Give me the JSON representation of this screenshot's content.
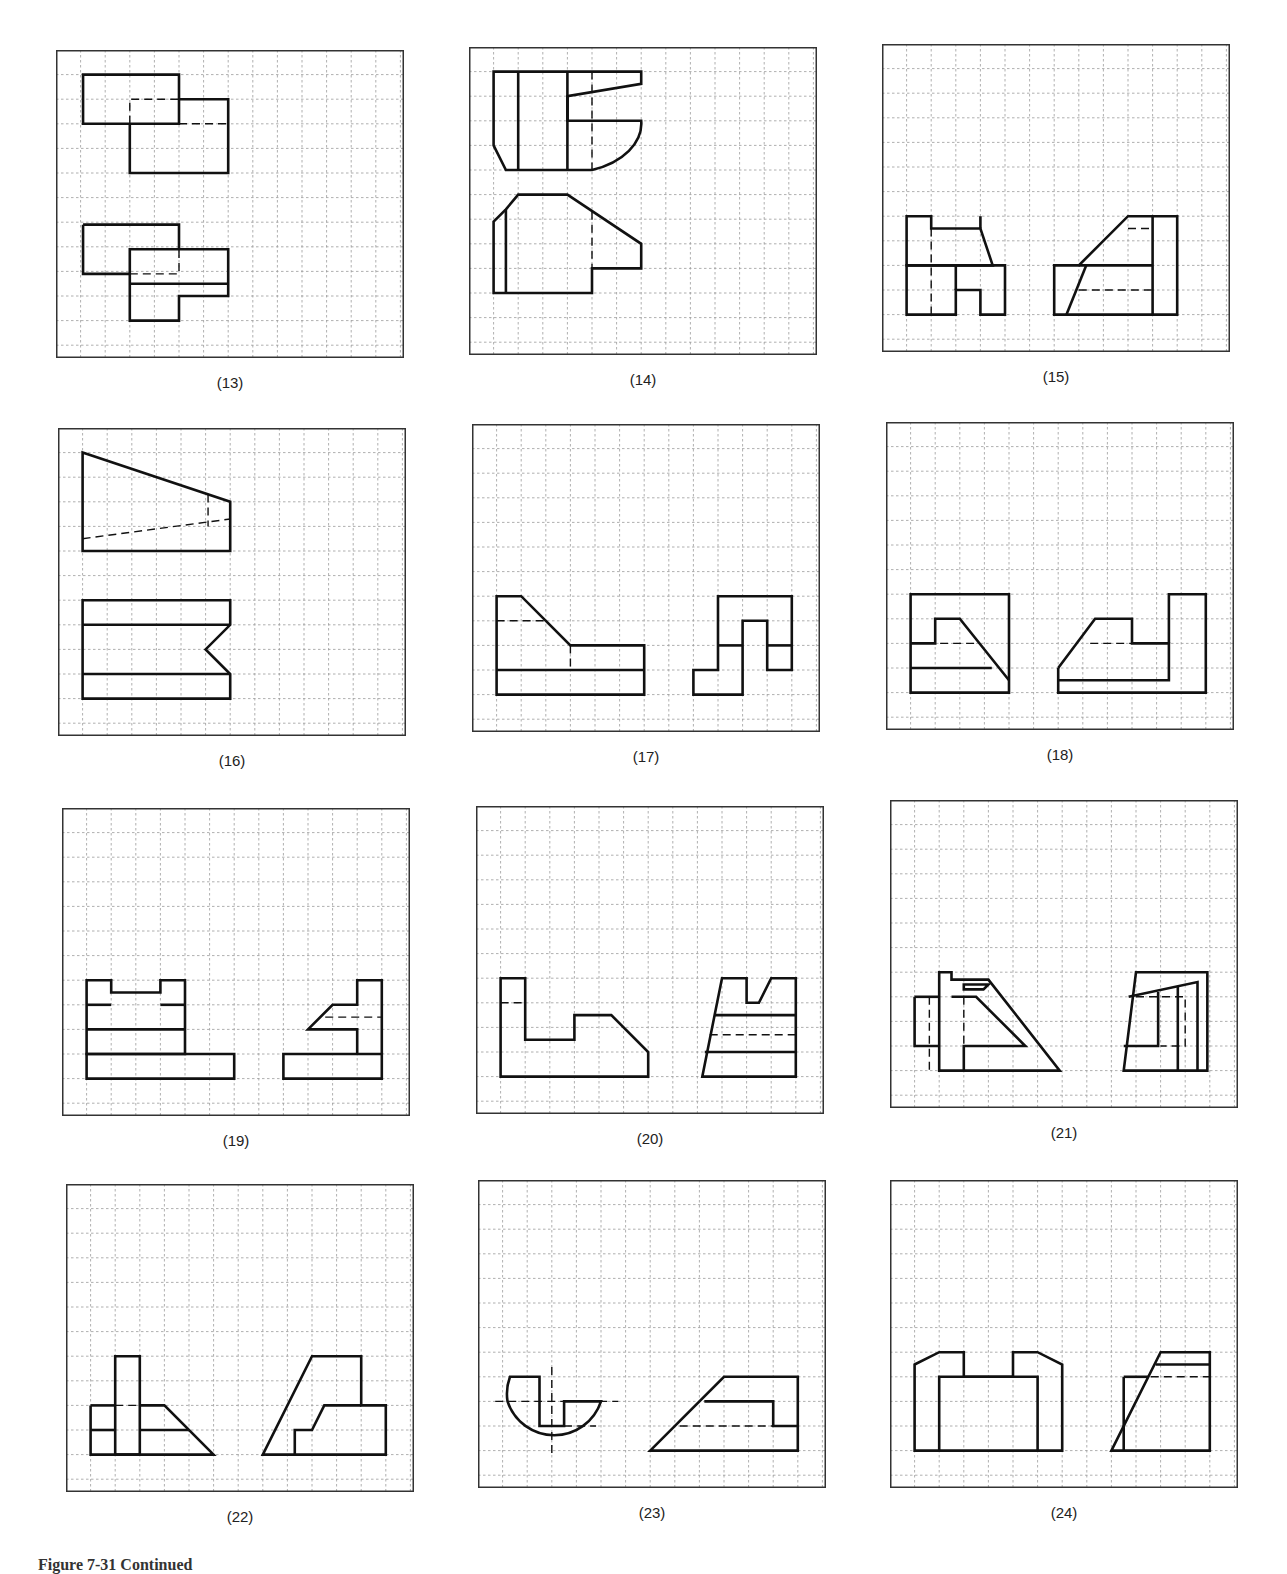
{
  "figure_caption": "Figure 7-31  Continued",
  "style": {
    "grid_color": "#9a9a9a",
    "line_color": "#111111",
    "frame_color": "#333333"
  },
  "grid": {
    "cols": 14,
    "rows": 12.3,
    "cell": 24.6
  },
  "panels": [
    {
      "label": "(13)",
      "x": 56,
      "y": 50,
      "w": 348,
      "h": 308,
      "solid": [
        "M1.1,1 L5,1 L5,3 L1.1,3 Z",
        "M5,2 L7,2 L7,5 L3,5 L3,3",
        "M1.1,7.1 L5,7.1 L5,8.1",
        "M1.1,7.1 L1.1,9.1 L3,9.1",
        "M3,8.1 L7,8.1 L7,10 L5,10 L5,11 L3,11 Z",
        "M3,9.5 L7,9.5"
      ],
      "dashed": [
        "M3,3 L3,2 L5,2",
        "M5,3 L7,3",
        "M3,9.1 L5,9.1 L5,8.1"
      ]
    },
    {
      "label": "(14)",
      "x": 469,
      "y": 47,
      "w": 348,
      "h": 308,
      "solid": [
        "M1,1 L7,1 L7,1.5 L4,2 L4,3 L7,3 A3,2 0 0,1 5,5 L1.5,5 L1,4 Z",
        "M2,1 L2,5",
        "M4,1 L4,5",
        "M4,2 L4,3",
        "M1,7.1 L1.5,6.6 L2,6 L4,6 L7,8 L7,9 L5,9 L5,10 L1,10 Z",
        "M1.5,6.6 L1.5,10"
      ],
      "dashed": [
        "M5,1 L5,5",
        "M5,6.7 L5,9"
      ]
    },
    {
      "label": "(15)",
      "x": 882,
      "y": 44,
      "w": 348,
      "h": 308,
      "solid": [
        "M1,7 L2,7 L2,7.5 L4,7.5 L4.5,9 L1,9 Z",
        "M4,7 L4,7.5",
        "M1,9 L5,9 L5,11 L4,11 L4,10 L3,10 L3,11 L1,11 Z",
        "M3,9 L3,10",
        "M7,9 L8,9 L10,7 L12,7 L12,11 L7,11 Z",
        "M8,9 L11,9",
        "M11,7 L11,11",
        "M8.3,9 L7.5,11"
      ],
      "dashed": [
        "M2,7.5 L2,11",
        "M10,7.5 L11,7.5",
        "M8,10 L11,10"
      ]
    },
    {
      "label": "(16)",
      "x": 58,
      "y": 428,
      "w": 348,
      "h": 308,
      "solid": [
        "M1,1 L7,3 L7,5 L1,5 Z",
        "M1,7 L7,7 L7,8 L6,9 L7,10 L7,11 L1,11 Z",
        "M1,8 L7,8",
        "M1,10 L7,10"
      ],
      "dashed": [
        "M1,4.5 L7,3.7",
        "M6.1,2.7 L6.1,4"
      ]
    },
    {
      "label": "(17)",
      "x": 472,
      "y": 424,
      "w": 348,
      "h": 308,
      "solid": [
        "M1,7 L2,7 L4,9 L7,9 L7,11 L1,11 Z",
        "M1,10 L7,10",
        "M10,7 L13,7 L13,10 L12,10 L12,8 L11,8 L11,11 L9,11 L9,10 L10,10 Z",
        "M10,9 L11,9",
        "M12,9 L13,9"
      ],
      "dashed": [
        "M1,8 L3,8",
        "M4,9 L4,10"
      ]
    },
    {
      "label": "(18)",
      "x": 886,
      "y": 422,
      "w": 348,
      "h": 308,
      "solid": [
        "M1,7 L5,7 L5,11 L1,11 Z",
        "M1,9 L2,9 L2,8 L3,8 L5,10.5",
        "M1,10 L4.3,10",
        "M7,10 L8.5,8 L10,8 L10,9 L11.5,9 L11.5,10.5 L7,10.5",
        "M7,10 L7,11 L13,11 L13,7 L11.5,7 L11.5,9"
      ],
      "dashed": [
        "M2.2,9 L3.8,9",
        "M8.3,9 L10,9"
      ]
    },
    {
      "label": "(19)",
      "x": 62,
      "y": 808,
      "w": 348,
      "h": 308,
      "solid": [
        "M1,7 L2,7 L2,7.5 L4,7.5 L4,7 L5,7 L5,10 L1,10 Z",
        "M1,8 L2,8",
        "M4,8 L5,8",
        "M1,9 L5,9",
        "M1,10 L7,10 L7,11 L1,11 Z",
        "M9,10 L13,10 L13,11 L9,11 Z",
        "M12,10 L12,9 L10,9 L11,8 L12,8 L12,7 L13,7 L13,10"
      ],
      "dashed": [
        "M10.7,8.5 L13,8.5"
      ]
    },
    {
      "label": "(20)",
      "x": 476,
      "y": 806,
      "w": 348,
      "h": 308,
      "solid": [
        "M1,7 L2,7 L2,9.5 L4,9.5 L4,8.5 L5.5,8.5 L7,10 L7,11 L1,11 Z",
        "M9.2,11 L10,7 L11,7 L11,8 L11.5,8 L12,7 L13,7 L13,11 Z",
        "M9.7,8.5 L13,8.5",
        "M9.3,10 L13,10"
      ],
      "dashed": [
        "M1,8 L2,8",
        "M9.5,9.3 L13,9.3"
      ]
    },
    {
      "label": "(21)",
      "x": 890,
      "y": 800,
      "w": 348,
      "h": 308,
      "solid": [
        "M2,7 L2.5,7 L2.5,7.3 L4,7.3 L6.9,11 L2,11 Z",
        "M1,8 L2,8",
        "M1,8 L1,10 L2,10",
        "M3,7.7 L3.8,7.7 L4,7.5 L3,7.5 Z",
        "M2.5,8 L3.5,8 L5.5,10 L3,10 L3,11",
        "M9.5,11 L10,7 L12.9,7 L12.9,11 Z",
        "M9.7,8 L12.5,7.4 L12.5,11",
        "M11.7,7.6 L11.7,11",
        "M10.9,7.8 L10.9,10 L9.5,10"
      ],
      "dashed": [
        "M1.6,8 L1.6,11",
        "M2,8 L2,11",
        "M3,8 L3,10",
        "M10,8 L12,8 L12,10 L11,10"
      ]
    },
    {
      "label": "(22)",
      "x": 66,
      "y": 1184,
      "w": 348,
      "h": 308,
      "solid": [
        "M2,7 L3,7 L3,11 L2,11 Z",
        "M1,9 L2,9",
        "M1,9 L1,11 L6,11 L4,9 L3,9",
        "M1,10 L2,10",
        "M3,10 L5,10",
        "M8,11 L10,7 L12,7 L12,9 L13,9 L13,11 Z",
        "M12,9 L10.5,9 L10,10 L9.3,10 L9.3,11"
      ],
      "dashed": [
        "M2,9 L3,9"
      ]
    },
    {
      "label": "(23)",
      "x": 478,
      "y": 1180,
      "w": 348,
      "h": 308,
      "solid": [
        "M1.3,8 L2.5,8 L2.5,10 L3.5,10 L3.5,9 L5,9 A2,2 0 0,1 1.2,9 A2,2 0 0,1 1.3,8 Z",
        "M7,11 L10,8 L13,8 L13,11 Z",
        "M9.2,9 L12,9 L12,10 L13,10"
      ],
      "dashed": [
        "M0.7,9 L5.7,9",
        "M3,7.6 L3,11.1",
        "M3.5,10 L4.8,10",
        "M8.2,10 L12,10"
      ]
    },
    {
      "label": "(24)",
      "x": 890,
      "y": 1180,
      "w": 348,
      "h": 308,
      "solid": [
        "M1,7.5 L2,7 L3,7 L3,8 L5,8 L5,7 L6,7 L7,7.5 L7,11 L1,11 Z",
        "M2,11 L2,8 L6,8 L6,11",
        "M9,11 L11,7 L13,7 L13,11 Z",
        "M10.8,7.5 L13,7.5",
        "M9.5,8 L10.5,8",
        "M9.5,8 L9.5,11"
      ],
      "dashed": [
        "M10.6,8 L13,8"
      ]
    }
  ]
}
